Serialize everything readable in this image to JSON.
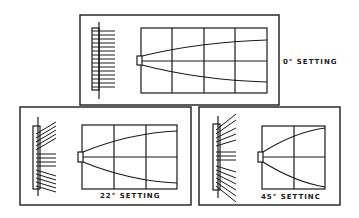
{
  "diagram": {
    "panels": [
      {
        "id": "setting-0",
        "label": "0° SETTING"
      },
      {
        "id": "setting-22",
        "label": "22° SETTING"
      },
      {
        "id": "setting-45",
        "label": "45° SETTINC"
      }
    ],
    "colors": {
      "ink": "#1a1a1a",
      "background": "#ffffff"
    }
  }
}
